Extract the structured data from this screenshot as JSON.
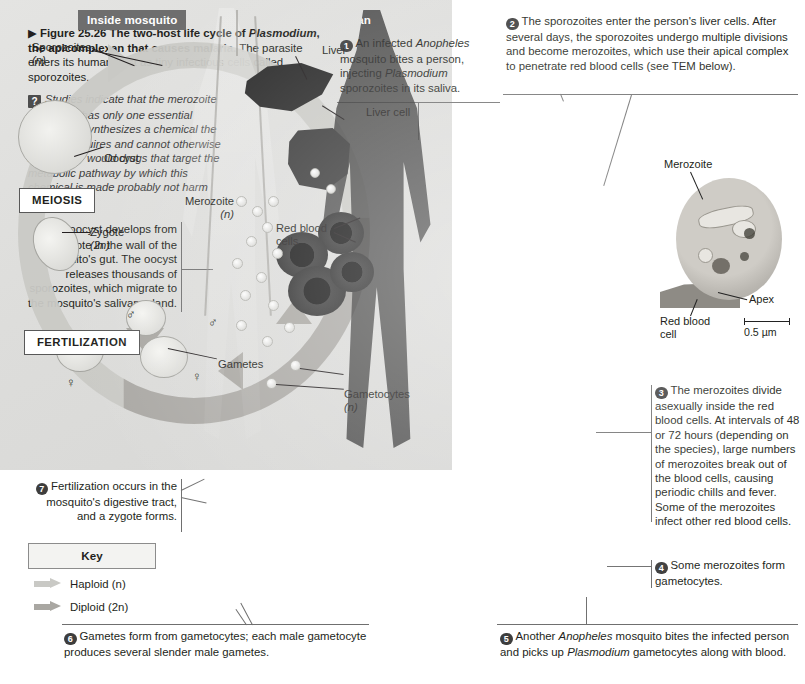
{
  "figure": {
    "arrow_marker": "▶",
    "number": "Figure 25.26",
    "title": "The two-host life cycle of",
    "title_italic": "Plasmodium",
    "title_rest": ", the apicomplexan that causes malaria.",
    "subtitle": "The parasite enters its human host as tiny infectious cells called sporozoites.",
    "question_icon": "?",
    "question": "Studies indicate that the merozoite apicoplast has only one essential function: It synthesizes a chemical the parasite requires and cannot otherwise make. Why would drugs that target the metabolic pathway by which this chemical is made probably not harm humans?"
  },
  "banners": {
    "mosquito": "Inside mosquito",
    "human": "Inside human",
    "mosquito_color": "#6e6e6e",
    "human_color": "#2a2a2a"
  },
  "process_boxes": [
    {
      "label": "MEIOSIS"
    },
    {
      "label": "FERTILIZATION"
    }
  ],
  "diagram_labels": [
    {
      "id": "sporozoites",
      "line1": "Sporozoites",
      "line2": "(n)"
    },
    {
      "id": "oocyst",
      "line1": "Oocyst",
      "line2": ""
    },
    {
      "id": "zygote",
      "line1": "Zygote",
      "line2": "(2n)"
    },
    {
      "id": "liver",
      "line1": "Liver",
      "line2": ""
    },
    {
      "id": "liver-cell",
      "line1": "Liver cell",
      "line2": ""
    },
    {
      "id": "merozoite",
      "line1": "Merozoite",
      "line2": "(n)"
    },
    {
      "id": "red-blood-cells",
      "line1": "Red blood",
      "line2": "cells"
    },
    {
      "id": "gametes",
      "line1": "Gametes",
      "line2": ""
    },
    {
      "id": "gametocytes",
      "line1": "Gametocytes",
      "line2": "(n)"
    }
  ],
  "sex_symbols": {
    "male": "♂",
    "female": "♀"
  },
  "steps": [
    {
      "number": "1",
      "parts": [
        {
          "t": "An infected ",
          "i": false
        },
        {
          "t": "Anopheles",
          "i": true
        },
        {
          "t": " mosquito bites a person, injecting ",
          "i": false
        },
        {
          "t": "Plasmodium",
          "i": true
        },
        {
          "t": " sporozoites in its saliva.",
          "i": false
        }
      ]
    },
    {
      "number": "2",
      "parts": [
        {
          "t": "The sporozoites enter the person's liver cells. After several days, the sporozoites undergo multiple divisions and become merozoites, which use their apical complex to penetrate red blood cells (see TEM below).",
          "i": false
        }
      ]
    },
    {
      "number": "3",
      "parts": [
        {
          "t": "The merozoites divide asexually inside the red blood cells. At intervals of 48 or 72 hours (depending on the species), large numbers of merozoites break out of the blood cells, causing periodic chills and fever. Some of the merozoites infect other red blood cells.",
          "i": false
        }
      ]
    },
    {
      "number": "4",
      "parts": [
        {
          "t": "Some merozoites form gametocytes.",
          "i": false
        }
      ]
    },
    {
      "number": "5",
      "parts": [
        {
          "t": "Another ",
          "i": false
        },
        {
          "t": "Anopheles",
          "i": true
        },
        {
          "t": " mosquito bites the infected person and picks up ",
          "i": false
        },
        {
          "t": "Plasmodium",
          "i": true
        },
        {
          "t": " gametocytes along with blood.",
          "i": false
        }
      ]
    },
    {
      "number": "6",
      "parts": [
        {
          "t": "Gametes form from gametocytes; each male gametocyte produces several slender male gametes.",
          "i": false
        }
      ]
    },
    {
      "number": "7",
      "parts": [
        {
          "t": "Fertilization occurs in the mosquito's digestive tract, and a zygote forms.",
          "i": false
        }
      ]
    },
    {
      "number": "8",
      "parts": [
        {
          "t": "An oocyst develops from the zygote in the wall of the mosquito's gut. The oocyst releases thousands of sporozoites, which migrate to the mosquito's salivary gland.",
          "i": false
        }
      ]
    }
  ],
  "key": {
    "title": "Key",
    "items": [
      {
        "label": "Haploid (n)",
        "color": "#c9c9c5"
      },
      {
        "label": "Diploid (2n)",
        "color": "#a9a7a2"
      }
    ]
  },
  "micrograph": {
    "labels": [
      {
        "id": "merozoite",
        "text": "Merozoite"
      },
      {
        "id": "apex",
        "text": "Apex"
      },
      {
        "id": "red-blood-cell",
        "line1": "Red blood",
        "line2": "cell"
      }
    ],
    "scale_bar": "0.5 µm"
  }
}
